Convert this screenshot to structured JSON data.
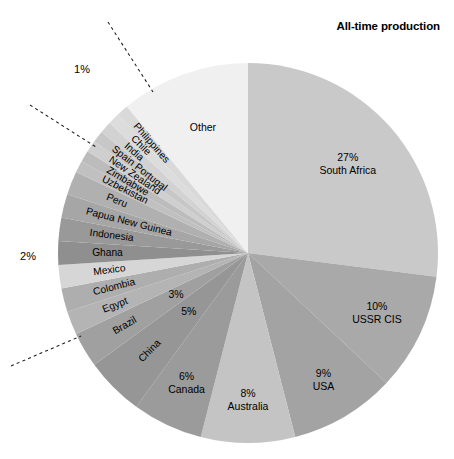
{
  "chart_data": {
    "type": "pie",
    "title": "All-time production",
    "xlabel": "",
    "ylabel": "",
    "legend_position": "none",
    "grid": false,
    "units": "percent",
    "start_angle_deg": 0,
    "direction": "clockwise",
    "categories": [
      "South Africa",
      "USSR CIS",
      "USA",
      "Australia",
      "Canada",
      "China",
      "Brazil",
      "Egypt",
      "Colombia",
      "Mexico",
      "Ghana",
      "Indonesia",
      "Papua New Guinea",
      "Peru",
      "Uzbekistan",
      "Zimbabwe",
      "New Zealand",
      "Spain Portugal",
      "India",
      "Chile",
      "Philippines",
      "Other"
    ],
    "values": [
      27,
      10,
      9,
      8,
      6,
      5,
      3,
      2,
      2,
      2,
      2,
      2,
      2,
      2,
      1,
      1,
      1,
      1,
      1,
      1,
      1,
      11
    ],
    "slices": [
      {
        "label": "South Africa",
        "value": 27,
        "pct_label": "27%",
        "show_pct": true,
        "fill": "#c9c9c9",
        "label_style": "radial-block",
        "label_r": 0.7
      },
      {
        "label": "USSR CIS",
        "value": 10,
        "pct_label": "10%",
        "show_pct": true,
        "fill": "#a9a9a9",
        "label_style": "radial-block",
        "label_r": 0.75
      },
      {
        "label": "USA",
        "value": 9,
        "pct_label": "9%",
        "show_pct": true,
        "fill": "#a3a3a3",
        "label_style": "radial-block",
        "label_r": 0.78
      },
      {
        "label": "Australia",
        "value": 8,
        "pct_label": "8%",
        "show_pct": true,
        "fill": "#c4c4c4",
        "label_style": "radial-block",
        "label_r": 0.78
      },
      {
        "label": "Canada",
        "value": 6,
        "pct_label": "6%",
        "show_pct": true,
        "fill": "#9b9b9b",
        "label_style": "radial-block",
        "label_r": 0.76
      },
      {
        "label": "China",
        "value": 5,
        "pct_label": "5%",
        "show_pct": true,
        "fill": "#969696",
        "label_style": "rotated",
        "label_r": 0.8
      },
      {
        "label": "Brazil",
        "value": 3,
        "pct_label": "3%",
        "show_pct": true,
        "fill": "#a0a0a0",
        "label_style": "rotated",
        "label_r": 0.82
      },
      {
        "label": "Egypt",
        "value": 2,
        "pct_label": "",
        "show_pct": false,
        "fill": "#b4b4b4",
        "label_style": "rotated",
        "label_r": 0.82
      },
      {
        "label": "Colombia",
        "value": 2,
        "pct_label": "",
        "show_pct": false,
        "fill": "#aeaeae",
        "label_style": "rotated",
        "label_r": 0.84
      },
      {
        "label": "Mexico",
        "value": 2,
        "pct_label": "",
        "show_pct": false,
        "fill": "#d6d6d6",
        "label_style": "rotated",
        "label_r": 0.82
      },
      {
        "label": "Ghana",
        "value": 2,
        "pct_label": "",
        "show_pct": false,
        "fill": "#8f8f8f",
        "label_style": "rotated",
        "label_r": 0.82
      },
      {
        "label": "Indonesia",
        "value": 2,
        "pct_label": "",
        "show_pct": false,
        "fill": "#999999",
        "label_style": "rotated",
        "label_r": 0.84
      },
      {
        "label": "Papua New Guinea",
        "value": 2,
        "pct_label": "",
        "show_pct": false,
        "fill": "#a6a6a6",
        "label_style": "rotated",
        "label_r": 0.88
      },
      {
        "label": "Peru",
        "value": 2,
        "pct_label": "",
        "show_pct": false,
        "fill": "#b0b0b0",
        "label_style": "rotated",
        "label_r": 0.8
      },
      {
        "label": "Uzbekistan",
        "value": 1,
        "pct_label": "",
        "show_pct": false,
        "fill": "#c0c0c0",
        "label_style": "rotated",
        "label_r": 0.86
      },
      {
        "label": "Zimbabwe",
        "value": 1,
        "pct_label": "",
        "show_pct": false,
        "fill": "#bcbcbc",
        "label_style": "rotated",
        "label_r": 0.86
      },
      {
        "label": "New Zealand",
        "value": 1,
        "pct_label": "",
        "show_pct": false,
        "fill": "#cfcfcf",
        "label_style": "rotated",
        "label_r": 0.88
      },
      {
        "label": "Spain Portugal",
        "value": 1,
        "pct_label": "",
        "show_pct": false,
        "fill": "#c7c7c7",
        "label_style": "rotated",
        "label_r": 0.9
      },
      {
        "label": "India",
        "value": 1,
        "pct_label": "",
        "show_pct": false,
        "fill": "#d2d2d2",
        "label_style": "rotated",
        "label_r": 0.86
      },
      {
        "label": "Chile",
        "value": 1,
        "pct_label": "",
        "show_pct": false,
        "fill": "#dcdcdc",
        "label_style": "rotated",
        "label_r": 0.86
      },
      {
        "label": "Philippines",
        "value": 1,
        "pct_label": "",
        "show_pct": false,
        "fill": "#d9d9d9",
        "label_style": "rotated",
        "label_r": 0.9
      },
      {
        "label": "Other",
        "value": 11,
        "pct_label": "",
        "show_pct": false,
        "fill": "#f0f0f0",
        "label_style": "plain",
        "label_r": 0.7
      }
    ],
    "callouts": [
      {
        "text": "1%",
        "text_x": 82,
        "text_y": 70,
        "lines": [
          {
            "x1": 108,
            "y1": 22,
            "x2": 153,
            "y2": 92
          },
          {
            "x1": 30,
            "y1": 105,
            "x2": 96,
            "y2": 147
          }
        ]
      },
      {
        "text": "2%",
        "text_x": 28,
        "text_y": 257,
        "lines": [
          {
            "x1": 11,
            "y1": 366,
            "x2": 81,
            "y2": 336
          }
        ]
      }
    ],
    "geometry": {
      "cx": 248,
      "cy": 253,
      "r": 190
    }
  },
  "figure": {
    "width": 454,
    "height": 459,
    "background": "#ffffff"
  }
}
